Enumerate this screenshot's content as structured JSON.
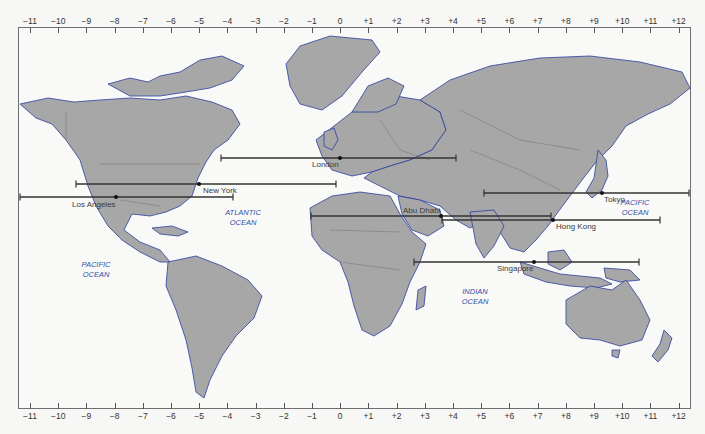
{
  "map": {
    "title": "World time zones",
    "colors": {
      "land": "#a7a7a7",
      "land_border": "#7a7a7a",
      "coast": "#2a3fa0",
      "ocean": "#f9f9f8",
      "bar": "#333333",
      "ocean_label": "#3450a8"
    },
    "top_axis": {
      "ticks": [
        "-11",
        "-10",
        "-9",
        "-8",
        "-7",
        "-6",
        "-5",
        "-4",
        "-3",
        "-2",
        "-1",
        "0",
        "+1",
        "+2",
        "+3",
        "+4",
        "+5",
        "+6",
        "+7",
        "+8",
        "+9",
        "+10",
        "+11",
        "+12"
      ]
    },
    "bottom_axis": {
      "ticks": [
        "-11",
        "-10",
        "-9",
        "-8",
        "-7",
        "-6",
        "-5",
        "-4",
        "-3",
        "-2",
        "-1",
        "0",
        "+1",
        "+2",
        "+3",
        "+4",
        "+5",
        "+6",
        "+7",
        "+8",
        "+9",
        "+10",
        "+11",
        "+12"
      ]
    },
    "cities": [
      {
        "name": "London",
        "y": 158,
        "x_start": 221,
        "x_end": 456,
        "dot_x": 340,
        "label_x": 312,
        "label_y": 160
      },
      {
        "name": "New York",
        "y": 184,
        "x_start": 76,
        "x_end": 336,
        "dot_x": 199,
        "label_x": 203,
        "label_y": 186
      },
      {
        "name": "Los Angeles",
        "y": 197,
        "x_start": 20,
        "x_end": 233,
        "dot_x": 116,
        "label_x": 72,
        "label_y": 200
      },
      {
        "name": "Tokyo",
        "y": 193,
        "x_start": 484,
        "x_end": 689,
        "dot_x": 602,
        "label_x": 604,
        "label_y": 195
      },
      {
        "name": "Abu Dhabi",
        "y": 216,
        "x_start": 311,
        "x_end": 551,
        "dot_x": 441,
        "label_x": 403,
        "label_y": 206
      },
      {
        "name": "Hong Kong",
        "y": 220,
        "x_start": 442,
        "x_end": 660,
        "dot_x": 553,
        "label_x": 556,
        "label_y": 222
      },
      {
        "name": "Singapore",
        "y": 262,
        "x_start": 414,
        "x_end": 639,
        "dot_x": 534,
        "label_x": 497,
        "label_y": 264
      }
    ],
    "oceans": [
      {
        "name": "ATLANTIC\nOCEAN",
        "x": 243,
        "y": 208
      },
      {
        "name": "PACIFIC\nOCEAN",
        "x": 96,
        "y": 260
      },
      {
        "name": "PACIFIC\nOCEAN",
        "x": 635,
        "y": 198
      },
      {
        "name": "INDIAN\nOCEAN",
        "x": 475,
        "y": 287
      }
    ]
  }
}
